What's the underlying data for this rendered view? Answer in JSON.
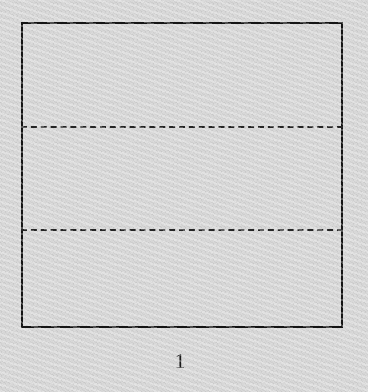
{
  "figure": {
    "kind": "folded-paper-diagram",
    "caption": "1",
    "caption_alt": "1",
    "background_color": "#dcdcdc",
    "ink_color": "#151515",
    "dash_color": "#262626",
    "canvas": {
      "width": 368,
      "height": 392
    },
    "outline": {
      "name": "paper-sheet-outline",
      "x": 21,
      "y": 22,
      "width": 322,
      "height": 306,
      "stroke_width": 2,
      "stroke_style": "solid",
      "stroke_color": "#151515"
    },
    "fold_lines": [
      {
        "name": "fold-line-upper",
        "orientation": "horizontal",
        "x": 21,
        "y": 126,
        "length": 322,
        "stroke_width": 2,
        "stroke_style": "dashed",
        "dash_length": 14,
        "gap_length": 7,
        "stroke_color": "#262626"
      },
      {
        "name": "fold-line-lower",
        "orientation": "horizontal",
        "x": 21,
        "y": 229,
        "length": 322,
        "stroke_width": 2,
        "stroke_style": "dashed",
        "dash_length": 14,
        "gap_length": 7,
        "stroke_color": "#262626"
      }
    ],
    "label": {
      "name": "figure-number-label",
      "text": "1",
      "x": 180,
      "y": 351,
      "font_size": 21,
      "color": "#1a1a1a"
    },
    "regions": [
      {
        "name": "band-top",
        "top": 22,
        "bottom": 126
      },
      {
        "name": "band-middle",
        "top": 126,
        "bottom": 229
      },
      {
        "name": "band-bottom",
        "top": 229,
        "bottom": 328
      }
    ]
  }
}
